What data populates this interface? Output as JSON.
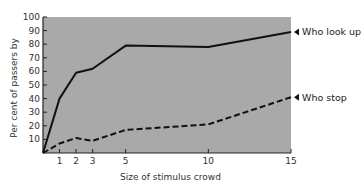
{
  "chart_data": {
    "type": "line",
    "title": "",
    "xlabel": "Size of stimulus crowd",
    "ylabel": "Per cent of passers by",
    "x": [
      0,
      1,
      2,
      3,
      5,
      10,
      15
    ],
    "xticks": [
      1,
      2,
      3,
      5,
      10,
      15
    ],
    "yticks": [
      10,
      20,
      30,
      40,
      50,
      60,
      70,
      80,
      90,
      100
    ],
    "xlim": [
      0,
      15
    ],
    "ylim": [
      0,
      100
    ],
    "grid": false,
    "legend_position": "right-inline",
    "series": [
      {
        "name": "Who look up",
        "style": "solid",
        "values": [
          0,
          40,
          59,
          62,
          79,
          78,
          89
        ]
      },
      {
        "name": "Who stop",
        "style": "dashed",
        "values": [
          0,
          7,
          11,
          9,
          17,
          21,
          41
        ]
      }
    ]
  },
  "colors": {
    "plot_background": "#a9a9a9",
    "line": "#111111",
    "text": "#333333"
  }
}
